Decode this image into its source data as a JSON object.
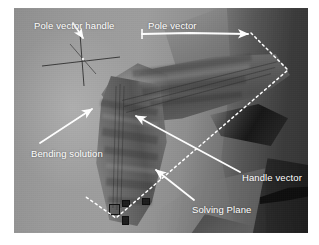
{
  "figure": {
    "kind": "3d-viewport-screenshot",
    "viewport": {
      "background_color": "#8f8f8f",
      "dark_color": "#3c3c3c",
      "annotation_color": "#ffffff",
      "wire_color": "#282828"
    }
  },
  "annotations": [
    {
      "id": "pole-vector-handle",
      "label": "Pole vector handle",
      "target": "crosshair manipulator at upper-left",
      "arrow": "short arrow pointing down-right from label to crosshair center"
    },
    {
      "id": "pole-vector",
      "label": "Pole vector",
      "target": "point at top-right of the solving plane",
      "arrow": "long horizontal arrow pointing right"
    },
    {
      "id": "bending-solution",
      "label": "Bending solution",
      "target": "seam on the bent forearm",
      "arrow": "arrow pointing up-right"
    },
    {
      "id": "handle-vector",
      "label": "Handle vector",
      "target": "mid-plane direction",
      "arrow": "long arrow pointing up-left"
    },
    {
      "id": "solving-plane",
      "label": "Solving Plane",
      "target": "dashed quadrilateral plane",
      "arrow": "arrow pointing up-left onto the dashed edge"
    }
  ],
  "overlays": {
    "solving_plane": {
      "style": "white dashed polyline",
      "dash": "2 3",
      "vertices": [
        {
          "x": 251,
          "y": 33
        },
        {
          "x": 288,
          "y": 70
        },
        {
          "x": 116,
          "y": 218
        },
        {
          "x": 86,
          "y": 197
        }
      ]
    },
    "pole_vector_handle_cross": {
      "style": "thin dark crosshair",
      "center": {
        "x": 68,
        "y": 51
      }
    }
  }
}
